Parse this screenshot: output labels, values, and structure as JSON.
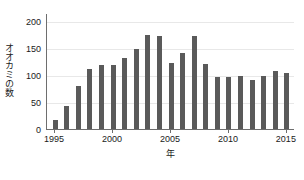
{
  "chart_data": {
    "type": "bar",
    "title": "",
    "xlabel": "年",
    "ylabel": "オオカミの数",
    "categories": [
      1995,
      1996,
      1997,
      1998,
      1999,
      2000,
      2001,
      2002,
      2003,
      2004,
      2005,
      2006,
      2007,
      2008,
      2009,
      2010,
      2011,
      2012,
      2013,
      2014,
      2015
    ],
    "values": [
      17,
      42,
      80,
      112,
      118,
      119,
      132,
      148,
      175,
      173,
      122,
      140,
      172,
      121,
      97,
      97,
      98,
      90,
      98,
      107,
      103
    ],
    "series": [
      {
        "name": "オオカミの数",
        "values": [
          17,
          42,
          80,
          112,
          118,
          119,
          132,
          148,
          175,
          173,
          122,
          140,
          172,
          121,
          97,
          97,
          98,
          90,
          98,
          107,
          103
        ]
      }
    ],
    "xlim": [
      1994.3,
      2015.7
    ],
    "ylim": [
      0,
      215
    ],
    "ytick_values": [
      0,
      50,
      100,
      150,
      200
    ],
    "ytick_labels": [
      "0",
      "50",
      "100",
      "150",
      "200"
    ],
    "xtick_values": [
      1995,
      2000,
      2005,
      2010,
      2015
    ],
    "xtick_labels": [
      "1995",
      "2000",
      "2005",
      "2010",
      "2015"
    ],
    "grid": "horizontal",
    "legend": "none",
    "bar_color": "#5a5a5a",
    "grid_color": "#e8e8e8",
    "axis_color": "#6e6e6e",
    "text_color": "#1a1a1a"
  }
}
